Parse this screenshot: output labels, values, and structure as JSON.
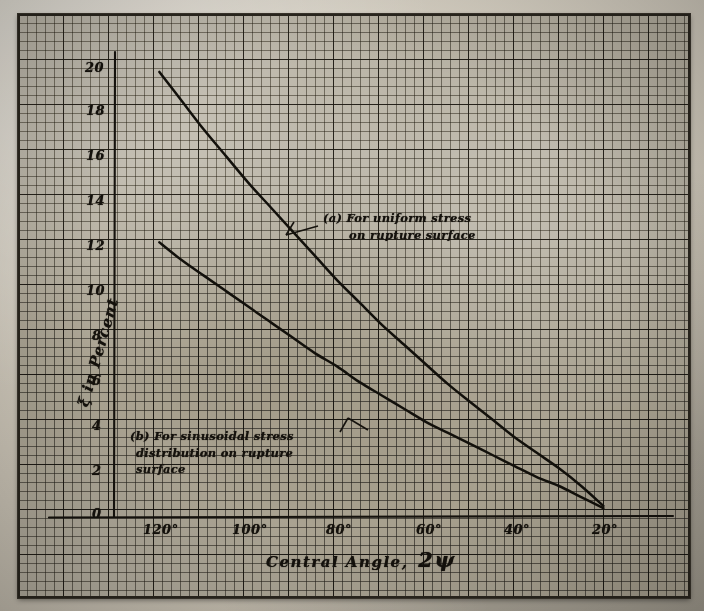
{
  "figure": {
    "medium": "scanned handwritten engineering graph on gridded paper",
    "paper_color": "#b5afa0",
    "ink_color": "#14110c"
  },
  "axes": {
    "y_title": "ξ in Percent",
    "x_title": "Central Angle,",
    "x_title_symbol": "2ψ",
    "y_ticks": [
      "20",
      "18",
      "16",
      "14",
      "12",
      "10",
      "8",
      "6",
      "4",
      "2",
      "0"
    ],
    "x_ticks": [
      "120°",
      "100°",
      "80°",
      "60°",
      "40°",
      "20°"
    ]
  },
  "annotations": [
    {
      "key": "curve-a-note",
      "line1": "(a)  For  uniform  stress",
      "line2": "on  rupture  surface",
      "line3": ""
    },
    {
      "key": "curve-b-note",
      "line1": "(b)  For  sinusoidal  stress",
      "line2": "distribution  on  rupture",
      "line3": "surface"
    }
  ],
  "chart_data": {
    "type": "line",
    "title": "",
    "subtitle": "",
    "xlabel": "Central Angle, 2ψ",
    "ylabel": "ξ in Percent",
    "xlim": [
      130,
      14
    ],
    "ylim": [
      0,
      21
    ],
    "x_reversed": true,
    "grid": true,
    "legend": "inline annotations on plot",
    "x_tick_values": [
      120,
      100,
      80,
      60,
      40,
      20
    ],
    "y_tick_values": [
      0,
      2,
      4,
      6,
      8,
      10,
      12,
      14,
      16,
      18,
      20
    ],
    "series": [
      {
        "name": "(a) For uniform stress on rupture surface",
        "label_short": "(a) uniform stress",
        "x": [
          120,
          115,
          110,
          105,
          100,
          95,
          90,
          85,
          80,
          75,
          70,
          65,
          60,
          55,
          50,
          45,
          40,
          35,
          30,
          25,
          20
        ],
        "values": [
          20.1,
          18.8,
          17.5,
          16.3,
          15.1,
          14.0,
          12.9,
          11.8,
          10.7,
          9.7,
          8.7,
          7.8,
          6.9,
          6.0,
          5.2,
          4.4,
          3.6,
          2.9,
          2.2,
          1.4,
          0.5
        ]
      },
      {
        "name": "(b) For sinusoidal stress distribution on rupture surface",
        "label_short": "(b) sinusoidal stress distribution",
        "x": [
          120,
          115,
          110,
          105,
          100,
          95,
          90,
          85,
          80,
          75,
          70,
          65,
          60,
          55,
          50,
          45,
          40,
          35,
          30,
          25,
          20
        ],
        "values": [
          12.4,
          11.6,
          10.9,
          10.2,
          9.5,
          8.8,
          8.1,
          7.4,
          6.8,
          6.1,
          5.5,
          4.9,
          4.3,
          3.8,
          3.3,
          2.8,
          2.3,
          1.8,
          1.4,
          0.9,
          0.4
        ]
      }
    ]
  }
}
